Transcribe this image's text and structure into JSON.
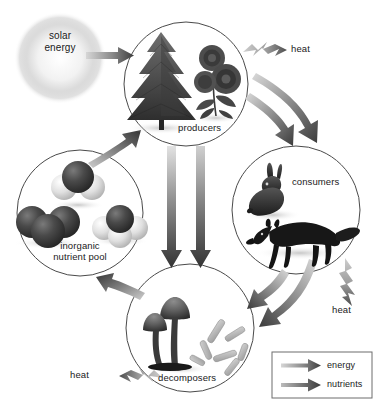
{
  "diagram": {
    "background_color": "#ffffff",
    "text_color": "#1a1a1a",
    "circle_stroke": "#4a4a4a"
  },
  "source": {
    "label_line1": "solar",
    "label_line2": "energy",
    "icon": "sun-glow-icon"
  },
  "nodes": [
    {
      "id": "producers",
      "label": "producers",
      "cx": 186,
      "cy": 84,
      "r": 62,
      "contents": [
        "conifer-tree-icon",
        "flowering-plant-icon"
      ]
    },
    {
      "id": "consumers",
      "label": "consumers",
      "cx": 296,
      "cy": 210,
      "r": 64,
      "contents": [
        "rabbit-icon",
        "fox-icon"
      ]
    },
    {
      "id": "decomposers",
      "label": "decomposers",
      "cx": 190,
      "cy": 328,
      "r": 64,
      "contents": [
        "mushroom-icon",
        "bacteria-rods-icon"
      ]
    },
    {
      "id": "inorganic-nutrient-pool",
      "label_line1": "inorganic",
      "label_line2": "nutrient pool",
      "cx": 80,
      "cy": 213,
      "r": 63,
      "contents": [
        "water-molecule-icon",
        "carbon-dioxide-molecule-icon",
        "methane-molecule-icon"
      ]
    }
  ],
  "heat_outputs": [
    {
      "id": "heat-producers",
      "label": "heat",
      "direction": "right"
    },
    {
      "id": "heat-consumers",
      "label": "heat",
      "direction": "down"
    },
    {
      "id": "heat-decomposers",
      "label": "heat",
      "direction": "left"
    }
  ],
  "flows": [
    {
      "from": "solar-energy",
      "to": "producers",
      "type": "energy"
    },
    {
      "from": "producers",
      "to": "consumers",
      "type": "energy"
    },
    {
      "from": "producers",
      "to": "consumers",
      "type": "nutrients"
    },
    {
      "from": "producers",
      "to": "decomposers",
      "type": "energy"
    },
    {
      "from": "producers",
      "to": "decomposers",
      "type": "nutrients"
    },
    {
      "from": "consumers",
      "to": "decomposers",
      "type": "energy"
    },
    {
      "from": "consumers",
      "to": "decomposers",
      "type": "nutrients"
    },
    {
      "from": "decomposers",
      "to": "inorganic-nutrient-pool",
      "type": "nutrients"
    },
    {
      "from": "inorganic-nutrient-pool",
      "to": "producers",
      "type": "nutrients"
    }
  ],
  "legend": {
    "items": [
      {
        "id": "legend-energy",
        "label": "energy",
        "arrow": "energy-arrow-icon"
      },
      {
        "id": "legend-nutrients",
        "label": "nutrients",
        "arrow": "nutrients-arrow-icon"
      }
    ],
    "border_color": "#6d6d6d"
  }
}
